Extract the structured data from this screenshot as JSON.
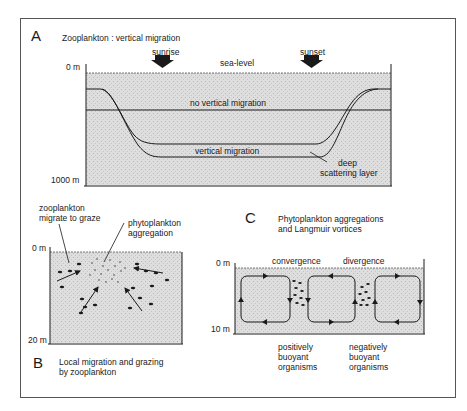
{
  "panel_a": {
    "letter": "A",
    "title": "Zooplankton  :  vertical migration",
    "depth_top": "0 m",
    "depth_bottom": "1000 m",
    "sunrise": "sunrise",
    "sunset": "sunset",
    "sea_level": "sea-level",
    "no_migration": "no vertical migration",
    "migration": "vertical migration",
    "dsl_line1": "deep",
    "dsl_line2": "scattering layer"
  },
  "panel_b": {
    "letter": "B",
    "caption_line1": "Local migration and grazing",
    "caption_line2": "by zooplankton",
    "zoo_label_line1": "zooplankton",
    "zoo_label_line2": "migrate to graze",
    "phyto_label_line1": "phytoplankton",
    "phyto_label_line2": "aggregation",
    "depth_top": "0 m",
    "depth_bottom": "20 m"
  },
  "panel_c": {
    "letter": "C",
    "title_line1": "Phytoplankton aggregations",
    "title_line2": "and Langmuir vortices",
    "depth_top": "0 m",
    "depth_bottom": "10 m",
    "convergence": "convergence",
    "divergence": "divergence",
    "pos_line1": "positively",
    "pos_line2": "buoyant",
    "pos_line3": "organisms",
    "neg_line1": "negatively",
    "neg_line2": "buoyant",
    "neg_line3": "organisms"
  },
  "colors": {
    "water": "#d9d9d9",
    "line": "#1a1a1a"
  }
}
